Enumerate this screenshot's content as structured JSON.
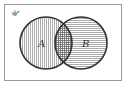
{
  "diagram": {
    "type": "venn",
    "universe_label": "𝒰",
    "sets": [
      {
        "name": "A",
        "label": "A",
        "shading": "vertical-lines"
      },
      {
        "name": "B",
        "label": "B",
        "shading": "horizontal-lines"
      }
    ],
    "intersection": {
      "shading": "crosshatch"
    },
    "colors": {
      "line": "#333333",
      "background": "#ffffff",
      "hatch": "#777777"
    }
  }
}
